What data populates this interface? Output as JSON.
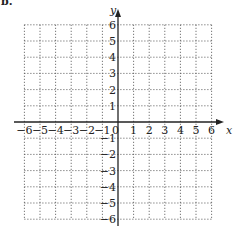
{
  "figure": {
    "corner_label": "b.",
    "x_axis_label": "x",
    "y_axis_label": "y",
    "x_ticks": [
      "-6",
      "-5",
      "-4",
      "-3",
      "-2",
      "-1",
      "0",
      "1",
      "2",
      "3",
      "4",
      "5",
      "6"
    ],
    "y_ticks_positive": [
      "1",
      "2",
      "3",
      "4",
      "5",
      "6"
    ],
    "y_ticks_negative": [
      "-1",
      "-2",
      "-3",
      "-4",
      "-5",
      "-6"
    ],
    "x_range": [
      -6,
      6
    ],
    "y_range": [
      -6,
      6
    ],
    "grid": "dotted",
    "grid_step": 1,
    "colors": {
      "axis": "#222222",
      "grid": "#555555",
      "background": "#ffffff"
    }
  }
}
